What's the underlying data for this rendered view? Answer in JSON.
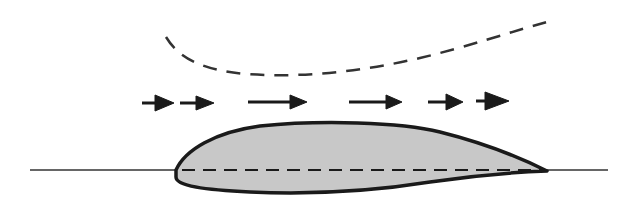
{
  "diagram": {
    "title": "Airfoil in airflow with chord line and streamline",
    "colors": {
      "background": "#ffffff",
      "stroke": "#1a1a1a",
      "airfoil_fill": "#c8c8c8",
      "line": "#333333"
    },
    "elements": {
      "streamline": {
        "label": "Curved streamline above airfoil",
        "style": "dashed"
      },
      "flow_arrows": {
        "label": "Airflow direction arrows",
        "count": 6,
        "direction": "right"
      },
      "airfoil": {
        "label": "Cambered airfoil cross-section"
      },
      "chord_line": {
        "label": "Chord line",
        "style": "dashed"
      },
      "reference_line": {
        "label": "Horizontal reference line",
        "style": "solid"
      }
    }
  }
}
